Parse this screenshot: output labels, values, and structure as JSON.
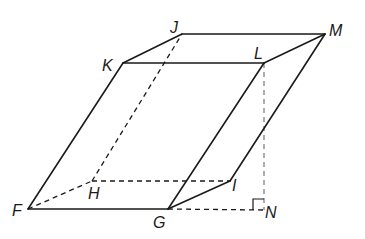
{
  "diagram": {
    "type": "oblique prism (parallelepiped) with height",
    "colors": {
      "stroke": "#1a1a1a",
      "height_line": "#8a8a8a",
      "background": "#ffffff"
    },
    "vertices": {
      "F": {
        "label": "F",
        "x": 28,
        "y": 209,
        "lx": 12,
        "ly": 203
      },
      "G": {
        "label": "G",
        "x": 168,
        "y": 209,
        "lx": 153,
        "ly": 215
      },
      "H": {
        "label": "H",
        "x": 92,
        "y": 181,
        "lx": 88,
        "ly": 186
      },
      "I": {
        "label": "I",
        "x": 230,
        "y": 181,
        "lx": 232,
        "ly": 178
      },
      "J": {
        "label": "J",
        "x": 182,
        "y": 34,
        "lx": 170,
        "ly": 20
      },
      "K": {
        "label": "K",
        "x": 123,
        "y": 63,
        "lx": 102,
        "ly": 58
      },
      "L": {
        "label": "L",
        "x": 264,
        "y": 63,
        "lx": 254,
        "ly": 46
      },
      "M": {
        "label": "M",
        "x": 325,
        "y": 34,
        "lx": 329,
        "ly": 23
      },
      "N": {
        "label": "N",
        "x": 264,
        "y": 210,
        "lx": 265,
        "ly": 205
      }
    },
    "solid_edges": [
      [
        "K",
        "J"
      ],
      [
        "J",
        "M"
      ],
      [
        "K",
        "L"
      ],
      [
        "L",
        "M"
      ],
      [
        "F",
        "K"
      ],
      [
        "G",
        "L"
      ],
      [
        "I",
        "M"
      ],
      [
        "F",
        "G"
      ],
      [
        "G",
        "I"
      ]
    ],
    "hidden_edges": [
      [
        "F",
        "H"
      ],
      [
        "H",
        "I"
      ],
      [
        "H",
        "J"
      ],
      [
        "G",
        "N"
      ]
    ],
    "height_segment": [
      "L",
      "N"
    ],
    "right_angle_at": "N"
  }
}
